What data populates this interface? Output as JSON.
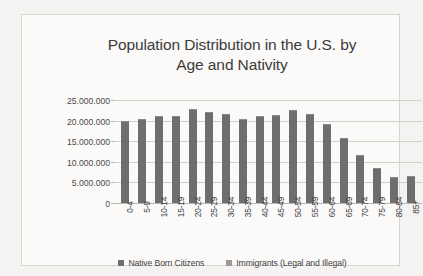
{
  "chart_data": {
    "type": "bar",
    "title": "Population Distribution in the U.S. by Age and Nativity",
    "title_line1": "Population Distribution in the U.S. by",
    "title_line2": "Age and Nativity",
    "xlabel": "",
    "ylabel": "",
    "ylim": [
      0,
      25000000
    ],
    "grid": true,
    "legend_position": "bottom",
    "categories": [
      "0-4",
      "5-9",
      "10-14",
      "15-19",
      "20-24",
      "25-29",
      "30-34",
      "35-39",
      "40-44",
      "45-49",
      "50-54",
      "55-59",
      "60-64",
      "65-69",
      "70-74",
      "75-79",
      "80-84",
      "85+"
    ],
    "ytick_labels": [
      "25.000.000",
      "20.000.000",
      "15.000.000",
      "10.000.000",
      "5.000.000",
      "0"
    ],
    "ytick_values": [
      25000000,
      20000000,
      15000000,
      10000000,
      5000000,
      0
    ],
    "series": [
      {
        "name": "Native Born Citizens",
        "color": "#6e6e6e",
        "values": [
          19800000,
          20500000,
          21000000,
          21200000,
          22800000,
          22100000,
          21600000,
          20300000,
          21100000,
          21300000,
          22600000,
          21700000,
          19200000,
          15700000,
          11600000,
          8400000,
          6300000,
          6600000
        ]
      },
      {
        "name": "Immigrants (Legal and Illegal)",
        "color": "#9a9a9a",
        "values": [
          0,
          0,
          0,
          0,
          0,
          0,
          0,
          0,
          0,
          0,
          0,
          0,
          0,
          0,
          0,
          0,
          0,
          0
        ]
      }
    ],
    "legend": [
      "Native Born Citizens",
      "Immigrants (Legal and Illegal)"
    ]
  },
  "colors": {
    "bar": "#6e6e6e",
    "gridline": "#d2d0cd",
    "text": "#3f3f3f",
    "page_background": "#f4f3f1",
    "chart_background": "#fbfaf9"
  }
}
